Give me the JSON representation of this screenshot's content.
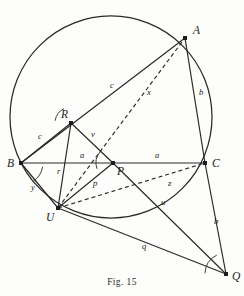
{
  "figure": {
    "caption": "Fig. 15",
    "colors": {
      "ink": "#1c1c1c",
      "line": "#2a2a2a",
      "background": "#fdfdfb"
    },
    "circle": {
      "cx": 111,
      "cy": 117,
      "r": 101
    },
    "points": [
      {
        "id": "A",
        "label": "A",
        "x": 185,
        "y": 38,
        "lx": 193,
        "ly": 34,
        "dot": true
      },
      {
        "id": "B",
        "label": "B",
        "x": 21,
        "y": 163,
        "lx": 7,
        "ly": 167,
        "dot": true
      },
      {
        "id": "C",
        "label": "C",
        "x": 205,
        "y": 163,
        "lx": 212,
        "ly": 167,
        "dot": true
      },
      {
        "id": "P",
        "label": "P",
        "x": 113,
        "y": 163,
        "lx": 117,
        "ly": 175,
        "dot": true
      },
      {
        "id": "R",
        "label": "R",
        "x": 71,
        "y": 123,
        "lx": 61,
        "ly": 118,
        "dot": true
      },
      {
        "id": "U",
        "label": "U",
        "x": 58,
        "y": 208,
        "lx": 46,
        "ly": 221,
        "dot": true
      },
      {
        "id": "Q",
        "label": "Q",
        "x": 226,
        "y": 274,
        "lx": 232,
        "ly": 280,
        "dot": true
      }
    ],
    "solid_segments": [
      {
        "name": "segment-B-A",
        "from": "B",
        "to": "A"
      },
      {
        "name": "segment-A-C",
        "from": "A",
        "to": "C"
      },
      {
        "name": "segment-B-C",
        "from": "B",
        "to": "C"
      },
      {
        "name": "segment-B-R",
        "from": "B",
        "to": "R"
      },
      {
        "name": "segment-R-P",
        "from": "R",
        "to": "P"
      },
      {
        "name": "segment-R-U",
        "from": "R",
        "to": "U"
      },
      {
        "name": "segment-U-P",
        "from": "U",
        "to": "P"
      },
      {
        "name": "segment-B-U",
        "from": "B",
        "to": "U"
      },
      {
        "name": "segment-U-Q",
        "from": "U",
        "to": "Q"
      },
      {
        "name": "segment-P-Q",
        "from": "P",
        "to": "Q"
      },
      {
        "name": "segment-C-Q",
        "from": "C",
        "to": "Q"
      }
    ],
    "dashed_segments": [
      {
        "name": "segment-U-A-dashed",
        "from": "U",
        "to": "A"
      },
      {
        "name": "segment-U-C-dashed",
        "from": "U",
        "to": "C"
      }
    ],
    "segment_labels": [
      {
        "id": "c-BA",
        "label": "c",
        "x": 110,
        "y": 88
      },
      {
        "id": "x-UA",
        "label": "x",
        "x": 147,
        "y": 95
      },
      {
        "id": "b-AC",
        "label": "b",
        "x": 199,
        "y": 95
      },
      {
        "id": "c-BR",
        "label": "c",
        "x": 38,
        "y": 139
      },
      {
        "id": "v-RP",
        "label": "v",
        "x": 91,
        "y": 137
      },
      {
        "id": "a-BP",
        "label": "a",
        "x": 80,
        "y": 158
      },
      {
        "id": "a-PC",
        "label": "a",
        "x": 155,
        "y": 158
      },
      {
        "id": "r-RU",
        "label": "r",
        "x": 57,
        "y": 174
      },
      {
        "id": "p-UP",
        "label": "p",
        "x": 93,
        "y": 186
      },
      {
        "id": "z-UC",
        "label": "z",
        "x": 168,
        "y": 186
      },
      {
        "id": "y-BU",
        "label": "y",
        "x": 31,
        "y": 190
      },
      {
        "id": "u-PQ",
        "label": "u",
        "x": 161,
        "y": 205
      },
      {
        "id": "b-CQ",
        "label": "b",
        "x": 214,
        "y": 224
      },
      {
        "id": "q-UQ",
        "label": "q",
        "x": 142,
        "y": 249
      }
    ],
    "angle_arcs": [
      {
        "name": "angle-arc-at-R",
        "cx": 71,
        "cy": 123,
        "r": 16,
        "a1": 188,
        "a2": 244
      },
      {
        "name": "angle-arc-at-P",
        "cx": 113,
        "cy": 163,
        "r": 17,
        "a1": 160,
        "a2": 222
      },
      {
        "name": "angle-arc-at-B",
        "cx": 21,
        "cy": 163,
        "r": 22,
        "a1": 10,
        "a2": 56
      },
      {
        "name": "angle-arc-at-Q",
        "cx": 226,
        "cy": 274,
        "r": 21,
        "a1": 182,
        "a2": 244
      }
    ]
  }
}
